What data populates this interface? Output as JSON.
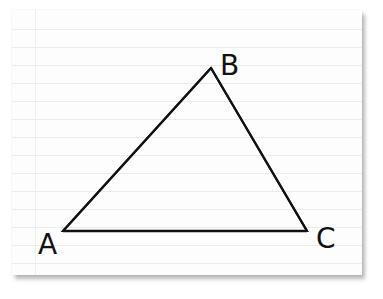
{
  "figure": {
    "type": "triangle",
    "stroke_color": "#111111",
    "paper_color": "#fdfdfd",
    "rule_line_color": "#ececec",
    "vertices": [
      {
        "label": "A",
        "x": 63,
        "y": 231
      },
      {
        "label": "B",
        "x": 211,
        "y": 68
      },
      {
        "label": "C",
        "x": 307,
        "y": 231
      }
    ],
    "labels": {
      "a": "A",
      "b": "B",
      "c": "C"
    }
  }
}
